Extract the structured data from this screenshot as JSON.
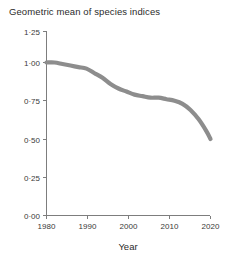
{
  "chart_data": {
    "type": "line",
    "title": "Geometric mean of species indices",
    "xlabel": "Year",
    "ylabel": "",
    "xlim": [
      1980,
      2021
    ],
    "ylim": [
      0.0,
      1.25
    ],
    "grid": false,
    "legend": null,
    "x_ticks": [
      1980,
      1990,
      2000,
      2010,
      2020
    ],
    "x_tick_labels": [
      "1980",
      "1990",
      "2000",
      "2010",
      "2020"
    ],
    "y_ticks": [
      0.0,
      0.25,
      0.5,
      0.75,
      1.0,
      1.25
    ],
    "y_tick_labels": [
      "0·00",
      "0·25",
      "0·50",
      "0·75",
      "1·00",
      "1·25"
    ],
    "series": [
      {
        "name": "Geometric mean of species indices",
        "color": "#8d8d8d",
        "x": [
          1980,
          1982,
          1984,
          1986,
          1988,
          1990,
          1992,
          1994,
          1996,
          1998,
          2000,
          2002,
          2004,
          2006,
          2008,
          2010,
          2012,
          2014,
          2016,
          2018,
          2020,
          2021
        ],
        "values": [
          1.0,
          1.0,
          0.99,
          0.98,
          0.97,
          0.96,
          0.93,
          0.9,
          0.86,
          0.83,
          0.81,
          0.79,
          0.78,
          0.77,
          0.77,
          0.76,
          0.75,
          0.73,
          0.69,
          0.63,
          0.55,
          0.5
        ]
      }
    ]
  },
  "axes": {
    "x_axis_label": "Year",
    "title_text": "Geometric mean of species indices"
  }
}
